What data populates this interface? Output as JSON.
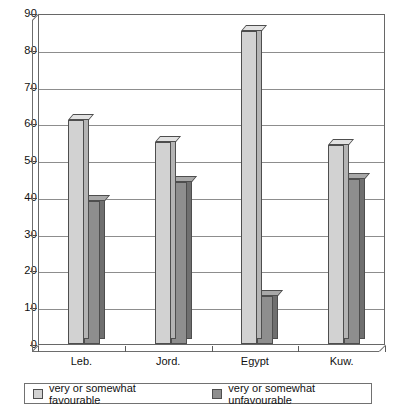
{
  "chart_data": {
    "type": "bar",
    "title": "",
    "subtitle": "",
    "xlabel": "",
    "ylabel": "",
    "categories": [
      "Leb.",
      "Jord.",
      "Egypt",
      "Kuw."
    ],
    "series": [
      {
        "name": "very or somewhat favourable",
        "values": [
          61,
          55,
          85,
          54
        ],
        "color": "#d2d2d2"
      },
      {
        "name": "very or somewhat unfavourable",
        "values": [
          39,
          44,
          13,
          45
        ],
        "color": "#8e8e8e"
      }
    ],
    "ylim": [
      0,
      90
    ],
    "yticks": [
      0,
      10,
      20,
      30,
      40,
      50,
      60,
      70,
      80,
      90
    ],
    "ytick_labels": [
      "0",
      "10",
      "20",
      "30",
      "40",
      "50",
      "60",
      "70",
      "80",
      "90"
    ],
    "grid": true,
    "grid_axis": "y",
    "legend_position": "bottom",
    "style": "3d-column"
  },
  "legend": {
    "items": [
      {
        "label": "very or somewhat favourable",
        "swatch": "light-gray-swatch"
      },
      {
        "label": "very or somewhat unfavourable",
        "swatch": "dark-gray-swatch"
      }
    ]
  }
}
